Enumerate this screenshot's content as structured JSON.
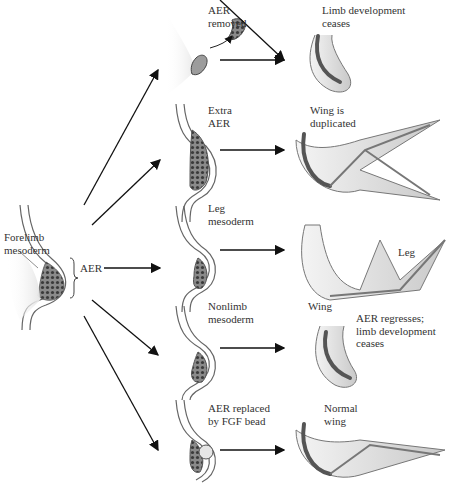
{
  "source": {
    "label_line1": "Forelimb",
    "label_line2": "mesoderm",
    "aer_label": "AER"
  },
  "experiments": [
    {
      "id": "aer-removed",
      "label_lines": [
        "AER",
        "removed"
      ],
      "result_lines": [
        "Limb development",
        "ceases"
      ]
    },
    {
      "id": "extra-aer",
      "label_lines": [
        "Extra",
        "AER"
      ],
      "result_lines": [
        "Wing is",
        "duplicated"
      ]
    },
    {
      "id": "leg-mesoderm",
      "label_lines": [
        "Leg",
        "mesoderm"
      ],
      "result_lines": [
        "Leg"
      ],
      "result_secondary": "Wing"
    },
    {
      "id": "nonlimb-mesoderm",
      "label_lines": [
        "Nonlimb",
        "mesoderm"
      ],
      "result_lines": [
        "AER regresses;",
        "limb development",
        "ceases"
      ]
    },
    {
      "id": "fgf-bead",
      "label_lines": [
        "AER replaced",
        "by FGF bead"
      ],
      "result_lines": [
        "Normal",
        "wing"
      ]
    }
  ],
  "colors": {
    "tissue": "#d4d4d4",
    "tissue_light": "#ececec",
    "outline": "#555555",
    "aer_cells": "#6e6e6e",
    "arrow": "#111111"
  }
}
